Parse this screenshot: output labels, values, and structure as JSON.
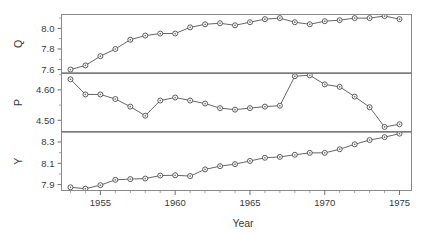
{
  "chart_data": {
    "type": "line",
    "title": "",
    "xlabel": "Year",
    "ylabel": "",
    "grid": false,
    "legend": "none",
    "multi_panel": true,
    "shared_x": true,
    "x": [
      1953,
      1954,
      1955,
      1956,
      1957,
      1958,
      1959,
      1960,
      1961,
      1962,
      1963,
      1964,
      1965,
      1966,
      1967,
      1968,
      1969,
      1970,
      1971,
      1972,
      1973,
      1974,
      1975
    ],
    "xlim": [
      1952.4,
      1975.8
    ],
    "xticks": [
      1955,
      1960,
      1965,
      1970,
      1975
    ],
    "xticklabels": [
      "1955",
      "1960",
      "1965",
      "1970",
      "1975"
    ],
    "panels": [
      {
        "name": "Q",
        "label": "Q",
        "ylim": [
          7.565,
          8.135
        ],
        "yticks": [
          7.6,
          7.8,
          8.0
        ],
        "yticklabels": [
          "7.6",
          "7.8",
          "8.0"
        ],
        "values": [
          7.6,
          7.64,
          7.73,
          7.8,
          7.89,
          7.93,
          7.95,
          7.95,
          8.01,
          8.04,
          8.05,
          8.03,
          8.06,
          8.09,
          8.1,
          8.06,
          8.04,
          8.07,
          8.08,
          8.1,
          8.1,
          8.12,
          8.09
        ]
      },
      {
        "name": "P",
        "label": "P",
        "ylim": [
          4.462,
          4.655
        ],
        "yticks": [
          4.5,
          4.6
        ],
        "yticklabels": [
          "4.50",
          "4.60"
        ],
        "values": [
          4.635,
          4.585,
          4.585,
          4.57,
          4.545,
          4.515,
          4.565,
          4.575,
          4.565,
          4.555,
          4.54,
          4.535,
          4.54,
          4.545,
          4.548,
          4.645,
          4.648,
          4.618,
          4.61,
          4.578,
          4.543,
          4.478,
          4.487
        ]
      },
      {
        "name": "Y",
        "label": "Y",
        "ylim": [
          7.845,
          8.395
        ],
        "yticks": [
          7.9,
          8.1,
          8.3
        ],
        "yticklabels": [
          "7.9",
          "8.1",
          "8.3"
        ],
        "values": [
          7.875,
          7.862,
          7.895,
          7.945,
          7.952,
          7.957,
          7.985,
          7.988,
          7.98,
          8.043,
          8.073,
          8.092,
          8.122,
          8.152,
          8.16,
          8.18,
          8.198,
          8.198,
          8.232,
          8.278,
          8.318,
          8.345,
          8.378
        ]
      }
    ]
  },
  "axis": {
    "xlabel": "Year"
  }
}
